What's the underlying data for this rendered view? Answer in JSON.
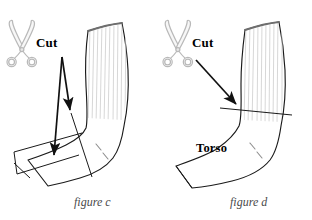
{
  "figures": [
    {
      "id": "figure-c",
      "caption": "figure c",
      "cut_label": "Cut",
      "scissors_icon": "scissors-icon",
      "arrows": 2,
      "body_label": null
    },
    {
      "id": "figure-d",
      "caption": "figure d",
      "cut_label": "Cut",
      "scissors_icon": "scissors-icon",
      "arrows": 1,
      "body_label": "Torso"
    }
  ],
  "colors": {
    "background": "#ffffff",
    "outline": "#1a1a1a",
    "rib_lines": "#c9c9c9",
    "scissors": "#b5b5b5",
    "caption_text": "#4a4a4a",
    "label_text": "#000000",
    "cuff_shadow": "#777777"
  }
}
